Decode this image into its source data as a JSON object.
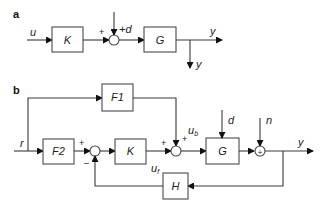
{
  "panel_a": {
    "label": "a",
    "input_signal": "u",
    "controller_block": "K",
    "plant_block": "G",
    "disturbance": "+d",
    "sum_sign_left": "+",
    "output_signal": "y",
    "measured_output": "y"
  },
  "panel_b": {
    "label": "b",
    "reference_signal": "r",
    "feedforward_block": "F1",
    "prefilter_block": "F2",
    "controller_block": "K",
    "plant_block": "G",
    "sensor_block": "H",
    "disturbance": "d",
    "noise": "n",
    "output_signal": "y",
    "feedforward_signal": "u",
    "feedforward_signal_sub": "b",
    "feedback_signal": "u",
    "feedback_signal_sub": "f",
    "sum1_plus": "+",
    "sum1_minus": "–",
    "sum2_plus_left": "+",
    "sum2_plus_top": "+",
    "sum3_symbol": "+"
  }
}
